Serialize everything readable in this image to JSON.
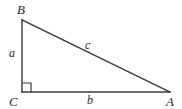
{
  "figure": {
    "kind": "right-triangle-diagram",
    "background_color": "#ffffff",
    "stroke_color": "#3a3a3a",
    "label_color": "#2b2b2b",
    "vertices": [
      {
        "name": "B",
        "label": "B",
        "x": 22,
        "y": 20
      },
      {
        "name": "C",
        "label": "C",
        "x": 22,
        "y": 92
      },
      {
        "name": "A",
        "label": "A",
        "x": 170,
        "y": 92
      }
    ],
    "sides": [
      {
        "name": "leg-vertical",
        "label": "a",
        "from": "B",
        "to": "C"
      },
      {
        "name": "leg-horizontal",
        "label": "b",
        "from": "C",
        "to": "A"
      },
      {
        "name": "hypotenuse",
        "label": "c",
        "from": "B",
        "to": "A"
      }
    ],
    "right_angle": {
      "at_vertex": "C",
      "marker": "square",
      "size": 9
    }
  }
}
